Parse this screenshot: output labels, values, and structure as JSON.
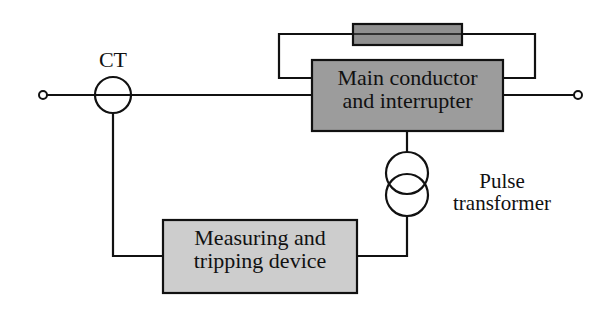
{
  "diagram": {
    "type": "circuit-block-diagram",
    "labels": {
      "ct": "CT",
      "main_line1": "Main conductor",
      "main_line2": "and interrupter",
      "pulse_line1": "Pulse",
      "pulse_line2": "transformer",
      "measure_line1": "Measuring and",
      "measure_line2": "tripping device"
    },
    "colors": {
      "line": "#111111",
      "main_box_fill": "#9c9c9c",
      "fuse_fill": "#8f8f8f",
      "measure_box_fill": "#cdcdcd"
    }
  }
}
